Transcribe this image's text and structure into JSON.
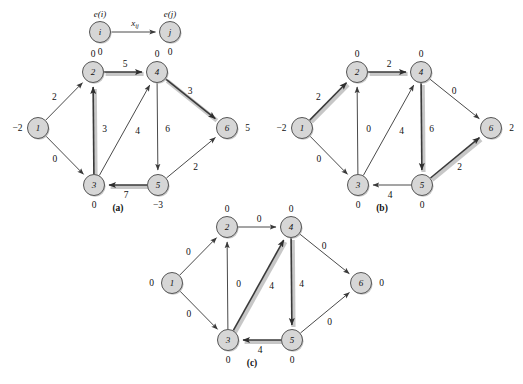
{
  "figure": {
    "background_color": "#ffffff",
    "node_fill": "#d6d6d6",
    "node_stroke": "#555555",
    "arc_color": "#4a4a4a",
    "highlight_color": "#bdbdbd"
  },
  "legend": {
    "source_node_label": "i",
    "target_node_label": "j",
    "source_excess_label": "e(i)",
    "target_excess_label": "e(j)",
    "source_excess_value": "0",
    "target_excess_value": "0",
    "arc_flow_label": "x",
    "arc_flow_subscript": "ij"
  },
  "panels": [
    {
      "id": "a",
      "caption": "(a)",
      "nodes": [
        {
          "id": "1",
          "label": "1",
          "excess": "−2",
          "excess_side": "left"
        },
        {
          "id": "2",
          "label": "2",
          "excess": "0",
          "excess_side": "top"
        },
        {
          "id": "3",
          "label": "3",
          "excess": "0",
          "excess_side": "bottom"
        },
        {
          "id": "4",
          "label": "4",
          "excess": "0",
          "excess_side": "top"
        },
        {
          "id": "5",
          "label": "5",
          "excess": "−3",
          "excess_side": "bottom"
        },
        {
          "id": "6",
          "label": "6",
          "excess": "5",
          "excess_side": "right"
        }
      ],
      "arcs": [
        {
          "from": "1",
          "to": "2",
          "flow": "2",
          "highlighted": false
        },
        {
          "from": "1",
          "to": "3",
          "flow": "0",
          "highlighted": false
        },
        {
          "from": "2",
          "to": "4",
          "flow": "5",
          "highlighted": true
        },
        {
          "from": "3",
          "to": "2",
          "flow": "3",
          "highlighted": true
        },
        {
          "from": "3",
          "to": "4",
          "flow": "4",
          "highlighted": false
        },
        {
          "from": "4",
          "to": "5",
          "flow": "6",
          "highlighted": false
        },
        {
          "from": "4",
          "to": "6",
          "flow": "3",
          "highlighted": true
        },
        {
          "from": "5",
          "to": "3",
          "flow": "7",
          "highlighted": true
        },
        {
          "from": "5",
          "to": "6",
          "flow": "2",
          "highlighted": false
        }
      ]
    },
    {
      "id": "b",
      "caption": "(b)",
      "nodes": [
        {
          "id": "1",
          "label": "1",
          "excess": "−2",
          "excess_side": "left"
        },
        {
          "id": "2",
          "label": "2",
          "excess": "0",
          "excess_side": "top"
        },
        {
          "id": "3",
          "label": "3",
          "excess": "0",
          "excess_side": "bottom"
        },
        {
          "id": "4",
          "label": "4",
          "excess": "0",
          "excess_side": "top"
        },
        {
          "id": "5",
          "label": "5",
          "excess": "0",
          "excess_side": "bottom"
        },
        {
          "id": "6",
          "label": "6",
          "excess": "2",
          "excess_side": "right"
        }
      ],
      "arcs": [
        {
          "from": "1",
          "to": "2",
          "flow": "2",
          "highlighted": true
        },
        {
          "from": "1",
          "to": "3",
          "flow": "0",
          "highlighted": false
        },
        {
          "from": "2",
          "to": "4",
          "flow": "2",
          "highlighted": true
        },
        {
          "from": "3",
          "to": "2",
          "flow": "0",
          "highlighted": false
        },
        {
          "from": "3",
          "to": "4",
          "flow": "4",
          "highlighted": false
        },
        {
          "from": "4",
          "to": "5",
          "flow": "6",
          "highlighted": true
        },
        {
          "from": "4",
          "to": "6",
          "flow": "0",
          "highlighted": false
        },
        {
          "from": "5",
          "to": "3",
          "flow": "4",
          "highlighted": false
        },
        {
          "from": "5",
          "to": "6",
          "flow": "2",
          "highlighted": true
        }
      ]
    },
    {
      "id": "c",
      "caption": "(c)",
      "nodes": [
        {
          "id": "1",
          "label": "1",
          "excess": "0",
          "excess_side": "left"
        },
        {
          "id": "2",
          "label": "2",
          "excess": "0",
          "excess_side": "top"
        },
        {
          "id": "3",
          "label": "3",
          "excess": "0",
          "excess_side": "bottom"
        },
        {
          "id": "4",
          "label": "4",
          "excess": "0",
          "excess_side": "top"
        },
        {
          "id": "5",
          "label": "5",
          "excess": "0",
          "excess_side": "bottom"
        },
        {
          "id": "6",
          "label": "6",
          "excess": "0",
          "excess_side": "right"
        }
      ],
      "arcs": [
        {
          "from": "1",
          "to": "2",
          "flow": "0",
          "highlighted": false
        },
        {
          "from": "1",
          "to": "3",
          "flow": "0",
          "highlighted": false
        },
        {
          "from": "2",
          "to": "4",
          "flow": "0",
          "highlighted": false
        },
        {
          "from": "3",
          "to": "2",
          "flow": "0",
          "highlighted": false
        },
        {
          "from": "3",
          "to": "4",
          "flow": "4",
          "highlighted": true
        },
        {
          "from": "4",
          "to": "5",
          "flow": "4",
          "highlighted": true
        },
        {
          "from": "4",
          "to": "6",
          "flow": "0",
          "highlighted": false
        },
        {
          "from": "5",
          "to": "3",
          "flow": "4",
          "highlighted": true
        },
        {
          "from": "5",
          "to": "6",
          "flow": "0",
          "highlighted": false
        }
      ]
    }
  ],
  "layout": {
    "node_radius": 10.5,
    "panel_origins": {
      "a": {
        "x": 0,
        "y": 0
      },
      "b": {
        "x": 264,
        "y": 0
      },
      "c": {
        "x": 134,
        "y": 155
      }
    },
    "node_positions": {
      "1": {
        "x": 38,
        "y": 128
      },
      "2": {
        "x": 93,
        "y": 72
      },
      "3": {
        "x": 94,
        "y": 185
      },
      "4": {
        "x": 157,
        "y": 72
      },
      "5": {
        "x": 158,
        "y": 185
      },
      "6": {
        "x": 227,
        "y": 128
      }
    },
    "caption_offset": {
      "x": 118,
      "y": 208
    },
    "legend": {
      "i_x": 100,
      "i_y": 32,
      "j_x": 170,
      "j_y": 32
    }
  }
}
